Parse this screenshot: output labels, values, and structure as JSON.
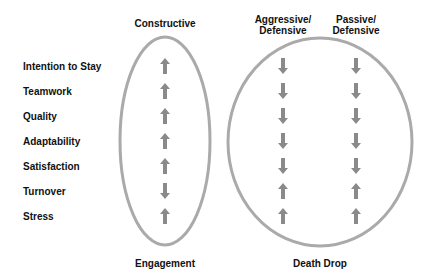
{
  "rows": [
    "Intention to Stay",
    "Teamwork",
    "Quality",
    "Adaptability",
    "Satisfaction",
    "Turnover",
    "Stress"
  ],
  "columns": [
    {
      "header": [
        "Constructive"
      ],
      "arrows": [
        "up",
        "up",
        "up",
        "up",
        "up",
        "down",
        "up"
      ]
    },
    {
      "header": [
        "Aggressive/",
        "Defensive"
      ],
      "arrows": [
        "down",
        "down",
        "down",
        "down",
        "down",
        "up",
        "up"
      ]
    },
    {
      "header": [
        "Passive/",
        "Defensive"
      ],
      "arrows": [
        "down",
        "down",
        "down",
        "down",
        "down",
        "up",
        "up"
      ]
    }
  ],
  "groups": [
    {
      "label": "Engagement",
      "columns": [
        0
      ]
    },
    {
      "label": "Death Drop",
      "columns": [
        1,
        2
      ]
    }
  ],
  "colors": {
    "arrow": "#8a8a8a",
    "ellipse": "#aaaaaa",
    "text": "#111111"
  }
}
